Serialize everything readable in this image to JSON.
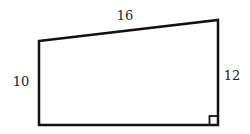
{
  "diagram": {
    "shape": "right trapezoid",
    "stroke_color": "#111111",
    "background": "#ffffff",
    "vertices": {
      "top_left": [
        39,
        41
      ],
      "top_right": [
        218,
        20
      ],
      "bottom_right": [
        218,
        125
      ],
      "bottom_left": [
        39,
        125
      ]
    },
    "labels": {
      "top": "16",
      "left": "10",
      "right": "12"
    },
    "right_angle_marker": {
      "corner": "bottom_right",
      "size": 9
    }
  }
}
